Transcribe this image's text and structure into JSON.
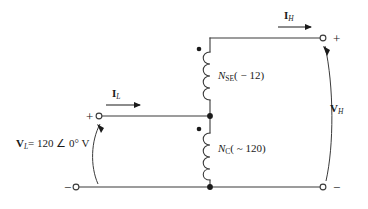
{
  "diagram": {
    "line_color": "#3a3a3a",
    "text_color": "#1a1a1a",
    "background": "#ffffff"
  },
  "sources": {
    "low_side_voltage": {
      "symbol": "V",
      "subscript": "L",
      "equation": "= 120 ∠ 0° V",
      "full": "V_L = 120 ∠ 0° V"
    },
    "high_side_voltage": {
      "symbol": "V",
      "subscript": "H",
      "full": "V_H"
    }
  },
  "currents": {
    "low_side": {
      "symbol": "I",
      "subscript": "L",
      "full": "I_L"
    },
    "high_side": {
      "symbol": "I",
      "subscript": "H",
      "full": "I_H"
    }
  },
  "windings": [
    {
      "id": "series-winding",
      "symbol": "N",
      "subscript": "SE",
      "turns_note": "( − 12)",
      "full": "N_SE ( − 12)"
    },
    {
      "id": "common-winding",
      "symbol": "N",
      "subscript": "C",
      "turns_note": "( ~ 120)",
      "full": "N_C ( ~ 120)"
    }
  ],
  "terminals": [
    {
      "id": "low-positive",
      "polarity": "+"
    },
    {
      "id": "low-negative",
      "polarity": "−"
    },
    {
      "id": "high-positive",
      "polarity": "+"
    },
    {
      "id": "high-negative",
      "polarity": "−"
    }
  ],
  "markers": {
    "polarity_dot_series": "•",
    "polarity_dot_common": "•",
    "junction_center": "•",
    "junction_bottom": "•"
  }
}
